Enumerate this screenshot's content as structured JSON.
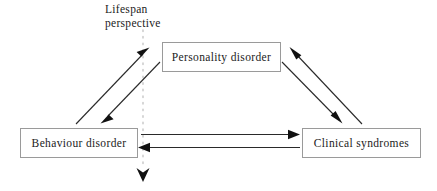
{
  "figure": {
    "type": "diagram",
    "kind": "triadic-relationship-diagram",
    "background_color": "#ffffff",
    "width": 437,
    "height": 191
  },
  "annotation": {
    "lifespan_line_1": "Lifespan",
    "lifespan_line_2": "perspective"
  },
  "nodes": [
    {
      "id": "personality-disorder",
      "label": "Personality disorder",
      "position": "top-center"
    },
    {
      "id": "behaviour-disorder",
      "label": "Behaviour disorder",
      "position": "bottom-left"
    },
    {
      "id": "clinical-syndromes",
      "label": "Clinical syndromes",
      "position": "bottom-right"
    }
  ],
  "edges": [
    {
      "id": "behaviour-to-personality",
      "from": "behaviour-disorder",
      "to": "personality-disorder",
      "direction": "up-right",
      "style": "solid-arrow"
    },
    {
      "id": "personality-to-behaviour",
      "from": "personality-disorder",
      "to": "behaviour-disorder",
      "direction": "down-left",
      "style": "solid-arrow"
    },
    {
      "id": "clinical-to-personality",
      "from": "clinical-syndromes",
      "to": "personality-disorder",
      "direction": "up-left",
      "style": "solid-arrow"
    },
    {
      "id": "personality-to-clinical",
      "from": "personality-disorder",
      "to": "clinical-syndromes",
      "direction": "down-right",
      "style": "solid-arrow"
    },
    {
      "id": "behaviour-to-clinical",
      "from": "behaviour-disorder",
      "to": "clinical-syndromes",
      "direction": "right",
      "style": "solid-arrow"
    },
    {
      "id": "clinical-to-behaviour",
      "from": "clinical-syndromes",
      "to": "behaviour-disorder",
      "direction": "left",
      "style": "solid-arrow"
    },
    {
      "id": "lifespan-timeline",
      "from": "lifespan-perspective-label",
      "to": "downward",
      "direction": "down",
      "style": "dotted-arrow"
    }
  ],
  "colors": {
    "box_border": "#9a9a9a",
    "box_fill": "#ffffff",
    "text": "#1b1b1b",
    "arrow_stroke": "#2a2a2a",
    "arrowhead_fill": "#111111",
    "dotted_line": "#cdcdcd"
  }
}
